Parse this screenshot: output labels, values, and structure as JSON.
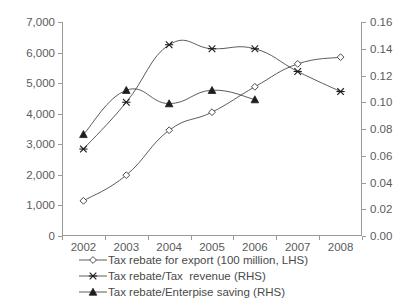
{
  "chart_data": {
    "type": "line",
    "title": "",
    "xlabel": "",
    "ylabel": "",
    "categories": [
      "2002",
      "2003",
      "2004",
      "2005",
      "2006",
      "2007",
      "2008"
    ],
    "grid": false,
    "legend_position": "bottom",
    "axes": {
      "left": {
        "label": "",
        "min": 0,
        "max": 7000,
        "step": 1000,
        "ticks": [
          "0",
          "1,000",
          "2,000",
          "3,000",
          "4,000",
          "5,000",
          "6,000",
          "7,000"
        ]
      },
      "right": {
        "label": "",
        "min": 0,
        "max": 0.16,
        "step": 0.02,
        "ticks": [
          "0.00",
          "0.02",
          "0.04",
          "0.06",
          "0.08",
          "0.10",
          "0.12",
          "0.14",
          "0.16"
        ]
      }
    },
    "series": [
      {
        "name": "Tax rebate for export (100 million, LHS)",
        "axis": "left",
        "marker": "open-diamond",
        "values": [
          1150,
          1990,
          3460,
          4050,
          4880,
          5630,
          5850
        ]
      },
      {
        "name": "Tax rebate/Tax  revenue (RHS)",
        "axis": "right",
        "marker": "star",
        "values": [
          0.065,
          0.1,
          0.143,
          0.14,
          0.14,
          0.123,
          0.108
        ]
      },
      {
        "name": "Tax rebate/Enterpise saving (RHS)",
        "axis": "right",
        "marker": "solid-triangle",
        "values": [
          0.076,
          0.109,
          0.099,
          0.109,
          0.102,
          null,
          null
        ]
      }
    ]
  },
  "legend": {
    "items": [
      {
        "label": "Tax rebate for export (100 million, LHS)",
        "marker": "open-diamond-icon"
      },
      {
        "label": "Tax rebate/Tax  revenue (RHS)",
        "marker": "star-icon"
      },
      {
        "label": "Tax rebate/Enterpise saving (RHS)",
        "marker": "solid-triangle-icon"
      }
    ]
  },
  "colors": {
    "line": "#4a4a4a",
    "axis": "#9a9a9a",
    "text": "#4a4a4a",
    "marker_fill": "#1d1d1d",
    "background": "#ffffff"
  }
}
